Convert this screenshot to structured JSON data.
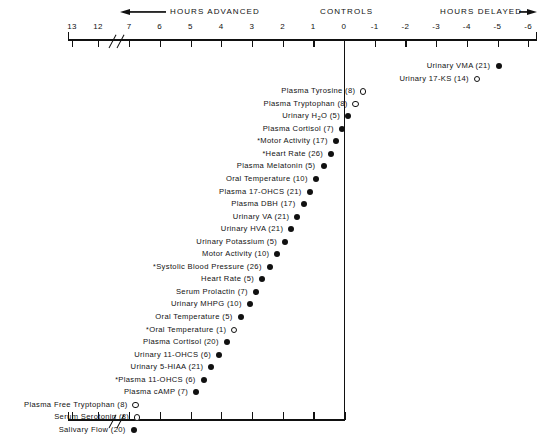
{
  "figure": {
    "header": {
      "advanced_label": "HOURS  ADVANCED",
      "controls_label": "CONTROLS",
      "delayed_label": "HOURS DELAYED",
      "left_arrow_icon": "arrow-left-icon",
      "right_arrow_icon": "arrow-right-icon"
    },
    "axis": {
      "title": "Hours advanced / delayed relative to controls",
      "tick_labels": [
        "13",
        "12",
        "7",
        "6",
        "5",
        "4",
        "3",
        "2",
        "1",
        "0",
        "-1",
        "-2",
        "-3",
        "-4",
        "-5",
        "-6"
      ],
      "tick_values": [
        13,
        12,
        7,
        6,
        5,
        4,
        3,
        2,
        1,
        0,
        -1,
        -2,
        -3,
        -4,
        -5,
        -6
      ],
      "break_between": [
        "12",
        "7"
      ],
      "control_value": 0
    }
  },
  "chart_data": {
    "type": "scatter",
    "xlabel": "HOURS ADVANCED  /  CONTROLS  /  HOURS DELAYED",
    "ylabel": "",
    "x_tick_labels": [
      "13",
      "12",
      "7",
      "6",
      "5",
      "4",
      "3",
      "2",
      "1",
      "0",
      "-1",
      "-2",
      "-3",
      "-4",
      "-5",
      "-6"
    ],
    "x_tick_values": [
      13,
      12,
      7,
      6,
      5,
      4,
      3,
      2,
      1,
      0,
      -1,
      -2,
      -3,
      -4,
      -5,
      -6
    ],
    "xlim": [
      13,
      -6
    ],
    "axis_break": "between 12 and 7",
    "grid": false,
    "legend": {
      "position": "none",
      "entries": [
        {
          "marker": "filled-circle",
          "meaning": "filled circle"
        },
        {
          "marker": "open-circle",
          "meaning": "open circle"
        },
        {
          "marker": "asterisk-prefix",
          "meaning": "asterisk prefix on label"
        }
      ]
    },
    "points": [
      {
        "label": "Urinary VMA",
        "n": 21,
        "display": "Urinary VMA (21)",
        "x": -5.0,
        "marker": "filled",
        "starred": false
      },
      {
        "label": "Urinary 17-KS",
        "n": 14,
        "display": "Urinary 17-KS (14)",
        "x": -4.3,
        "marker": "open",
        "starred": false
      },
      {
        "label": "Plasma Tyrosine",
        "n": 8,
        "display": "Plasma Tyrosine (8)",
        "x": -0.6,
        "marker": "open",
        "starred": false
      },
      {
        "label": "Plasma Tryptophan",
        "n": 8,
        "display": "Plasma Tryptophan (8)",
        "x": -0.35,
        "marker": "open",
        "starred": false
      },
      {
        "label": "Urinary H2O",
        "n": 5,
        "display": "Urinary H₂O (5)",
        "x": -0.1,
        "marker": "filled",
        "starred": false
      },
      {
        "label": "Plasma Cortisol",
        "n": 7,
        "display": "Plasma Cortisol (7)",
        "x": 0.1,
        "marker": "filled",
        "starred": false
      },
      {
        "label": "Motor Activity",
        "n": 17,
        "display": "Motor Activity (17)",
        "x": 0.3,
        "marker": "filled",
        "starred": true
      },
      {
        "label": "Heart Rate",
        "n": 26,
        "display": "Heart Rate (26)",
        "x": 0.45,
        "marker": "filled",
        "starred": true
      },
      {
        "label": "Plasma Melatonin",
        "n": 5,
        "display": "Plasma Melatonin (5)",
        "x": 0.7,
        "marker": "filled",
        "starred": false
      },
      {
        "label": "Oral Temperature",
        "n": 10,
        "display": "Oral Temperature (10)",
        "x": 0.95,
        "marker": "filled",
        "starred": false
      },
      {
        "label": "Plasma 17-OHCS",
        "n": 21,
        "display": "Plasma 17-OHCS (21)",
        "x": 1.15,
        "marker": "filled",
        "starred": false
      },
      {
        "label": "Plasma DBH",
        "n": 17,
        "display": "Plasma DBH (17)",
        "x": 1.35,
        "marker": "filled",
        "starred": false
      },
      {
        "label": "Urinary VA",
        "n": 21,
        "display": "Urinary VA (21)",
        "x": 1.55,
        "marker": "filled",
        "starred": false
      },
      {
        "label": "Urinary HVA",
        "n": 21,
        "display": "Urinary HVA (21)",
        "x": 1.75,
        "marker": "filled",
        "starred": false
      },
      {
        "label": "Urinary Potassium",
        "n": 5,
        "display": "Urinary Potassium (5)",
        "x": 1.95,
        "marker": "filled",
        "starred": false
      },
      {
        "label": "Motor Activity",
        "n": 10,
        "display": "Motor Activity (10)",
        "x": 2.2,
        "marker": "filled",
        "starred": false
      },
      {
        "label": "Systolic Blood Pressure",
        "n": 26,
        "display": "Systolic Blood Pressure (26)",
        "x": 2.45,
        "marker": "filled",
        "starred": true
      },
      {
        "label": "Heart Rate",
        "n": 5,
        "display": "Heart Rate (5)",
        "x": 2.7,
        "marker": "filled",
        "starred": false
      },
      {
        "label": "Serum Prolactin",
        "n": 7,
        "display": "Serum Prolactin (7)",
        "x": 2.9,
        "marker": "filled",
        "starred": false
      },
      {
        "label": "Urinary MHPG",
        "n": 10,
        "display": "Urinary MHPG (10)",
        "x": 3.1,
        "marker": "filled",
        "starred": false
      },
      {
        "label": "Oral Temperature",
        "n": 5,
        "display": "Oral Temperature (5)",
        "x": 3.4,
        "marker": "filled",
        "starred": false
      },
      {
        "label": "Oral Temperature",
        "n": 1,
        "display": "Oral Temperature (1)",
        "x": 3.6,
        "marker": "open",
        "starred": true
      },
      {
        "label": "Plasma Cortisol",
        "n": 20,
        "display": "Plasma Cortisol (20)",
        "x": 3.85,
        "marker": "filled",
        "starred": false
      },
      {
        "label": "Urinary 11-OHCS",
        "n": 6,
        "display": "Urinary 11-OHCS (6)",
        "x": 4.1,
        "marker": "filled",
        "starred": false
      },
      {
        "label": "Urinary 5-HIAA",
        "n": 21,
        "display": "Urinary 5-HIAA (21)",
        "x": 4.35,
        "marker": "filled",
        "starred": false
      },
      {
        "label": "Plasma 11-OHCS",
        "n": 6,
        "display": "Plasma 11-OHCS (6)",
        "x": 4.6,
        "marker": "filled",
        "starred": true
      },
      {
        "label": "Plasma cAMP",
        "n": 7,
        "display": "Plasma cAMP (7)",
        "x": 4.85,
        "marker": "filled",
        "starred": false
      },
      {
        "label": "Plasma Free Tryptophan",
        "n": 8,
        "display": "Plasma Free Tryptophan (8)",
        "x": 7.3,
        "marker": "open",
        "starred": false
      },
      {
        "label": "Serum Serotonin",
        "n": 8,
        "display": "Serum Serotonin (8)",
        "x": 7.1,
        "marker": "open",
        "starred": false
      },
      {
        "label": "Salivary Flow",
        "n": 20,
        "display": "Salivary Flow (20)",
        "x": 7.55,
        "marker": "filled",
        "starred": false
      }
    ]
  }
}
